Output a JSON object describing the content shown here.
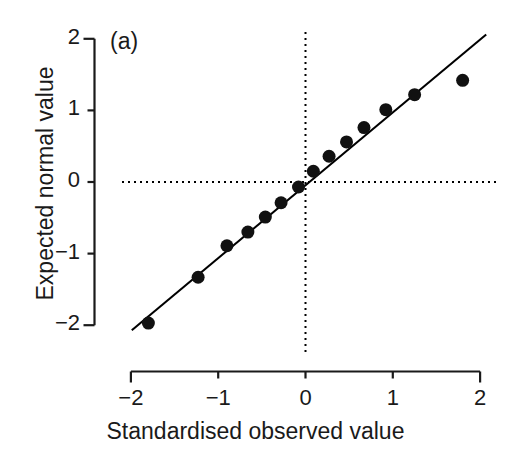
{
  "chart_data": {
    "type": "scatter",
    "title": "",
    "panel_label": "(a)",
    "xlabel": "Standardised observed value",
    "ylabel": "Expected normal value",
    "xlim": [
      -2.0,
      2.0
    ],
    "ylim": [
      -2.0,
      2.0
    ],
    "xticks": [
      -2,
      -1,
      0,
      1,
      2
    ],
    "yticks": [
      -2,
      -1,
      0,
      1,
      2
    ],
    "xtick_labels": [
      "−2",
      "−1",
      "0",
      "1",
      "2"
    ],
    "ytick_labels": [
      "−2",
      "−1",
      "0",
      "1",
      "2"
    ],
    "grid": false,
    "legend": null,
    "reference_lines": {
      "horizontal_zero": {
        "y": 0,
        "style": "dotted",
        "color": "#000000"
      },
      "vertical_zero": {
        "x": 0,
        "style": "dotted",
        "color": "#000000"
      }
    },
    "fit_line": {
      "style": "solid",
      "color": "#000000",
      "x_start": -1.99,
      "y_start": -2.07,
      "x_end": 2.07,
      "y_end": 2.06
    },
    "marker": {
      "shape": "circle",
      "color": "#111111",
      "size_px": 13
    },
    "points": [
      {
        "x": -1.8,
        "y": -1.97
      },
      {
        "x": -1.23,
        "y": -1.33
      },
      {
        "x": -0.9,
        "y": -0.89
      },
      {
        "x": -0.66,
        "y": -0.7
      },
      {
        "x": -0.46,
        "y": -0.49
      },
      {
        "x": -0.28,
        "y": -0.29
      },
      {
        "x": -0.08,
        "y": -0.07
      },
      {
        "x": 0.09,
        "y": 0.15
      },
      {
        "x": 0.27,
        "y": 0.36
      },
      {
        "x": 0.47,
        "y": 0.56
      },
      {
        "x": 0.67,
        "y": 0.76
      },
      {
        "x": 0.92,
        "y": 1.01
      },
      {
        "x": 1.25,
        "y": 1.22
      },
      {
        "x": 1.8,
        "y": 1.42
      }
    ]
  }
}
